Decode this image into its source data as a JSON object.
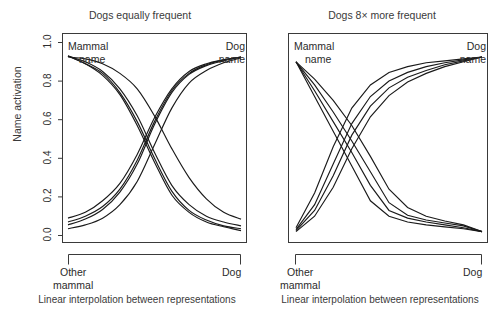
{
  "figure": {
    "background": "#ffffff",
    "line_color": "#1a1a1a",
    "axis_color": "#3a3a3a"
  },
  "panels": [
    {
      "id": "left",
      "title": "Dogs equally frequent",
      "caption": "Linear interpolation between representations",
      "ylabel": "Name activation",
      "ytick_labels": [
        "0.0",
        "0.2",
        "0.4",
        "0.6",
        "0.8",
        "1.0"
      ],
      "corner_label_left": "Mammal\nname",
      "corner_label_left_line1": "Mammal",
      "corner_label_left_line2": "name",
      "corner_label_right_line1": "Dog",
      "corner_label_right_line2": "name",
      "xaxis_left_line1": "Other",
      "xaxis_left_line2": "mammal",
      "xaxis_right": "Dog"
    },
    {
      "id": "right",
      "title": "Dogs 8× more frequent",
      "caption": "Linear interpolation between representations",
      "corner_label_left_line1": "Mammal",
      "corner_label_left_line2": "name",
      "corner_label_right_line1": "Dog",
      "corner_label_right_line2": "name",
      "xaxis_left_line1": "Other",
      "xaxis_left_line2": "mammal",
      "xaxis_right": "Dog"
    }
  ],
  "chart_data": [
    {
      "type": "line",
      "panel": "left",
      "title": "Dogs equally frequent",
      "xlabel": "Linear interpolation between representations",
      "ylabel": "Name activation",
      "xlim": [
        0,
        1
      ],
      "ylim": [
        0.0,
        1.0
      ],
      "yticks": [
        0.0,
        0.2,
        0.4,
        0.6,
        0.8,
        1.0
      ],
      "xtick_labels": [
        "Other mammal",
        "Dog"
      ],
      "grid": false,
      "legend": null,
      "annotations": [
        "Mammal name",
        "Dog name"
      ],
      "x": [
        0.0,
        0.1,
        0.2,
        0.3,
        0.4,
        0.5,
        0.6,
        0.7,
        0.8,
        0.9,
        1.0
      ],
      "series": [
        {
          "name": "mammal-name-1",
          "group": "mammal",
          "values": [
            0.93,
            0.9,
            0.85,
            0.76,
            0.62,
            0.43,
            0.26,
            0.16,
            0.1,
            0.07,
            0.05
          ]
        },
        {
          "name": "mammal-name-2",
          "group": "mammal",
          "values": [
            0.93,
            0.89,
            0.84,
            0.74,
            0.59,
            0.4,
            0.23,
            0.13,
            0.08,
            0.05,
            0.035
          ]
        },
        {
          "name": "mammal-name-3",
          "group": "mammal",
          "values": [
            0.93,
            0.89,
            0.83,
            0.73,
            0.57,
            0.38,
            0.21,
            0.12,
            0.07,
            0.045,
            0.025
          ]
        },
        {
          "name": "mammal-name-4",
          "group": "mammal",
          "values": [
            0.925,
            0.915,
            0.89,
            0.84,
            0.76,
            0.62,
            0.45,
            0.3,
            0.19,
            0.12,
            0.085
          ]
        },
        {
          "name": "dog-name-1",
          "group": "dog",
          "values": [
            0.09,
            0.12,
            0.18,
            0.27,
            0.42,
            0.61,
            0.76,
            0.85,
            0.89,
            0.91,
            0.925
          ]
        },
        {
          "name": "dog-name-2",
          "group": "dog",
          "values": [
            0.07,
            0.1,
            0.15,
            0.24,
            0.39,
            0.59,
            0.75,
            0.84,
            0.885,
            0.91,
            0.925
          ]
        },
        {
          "name": "dog-name-3",
          "group": "dog",
          "values": [
            0.055,
            0.085,
            0.135,
            0.225,
            0.37,
            0.575,
            0.74,
            0.835,
            0.88,
            0.905,
            0.925
          ]
        },
        {
          "name": "dog-name-4",
          "group": "dog",
          "values": [
            0.035,
            0.055,
            0.09,
            0.16,
            0.28,
            0.47,
            0.66,
            0.79,
            0.855,
            0.895,
            0.92
          ]
        }
      ]
    },
    {
      "type": "line",
      "panel": "right",
      "title": "Dogs 8× more frequent",
      "xlabel": "Linear interpolation between representations",
      "ylabel": "Name activation",
      "xlim": [
        0,
        1
      ],
      "ylim": [
        0.0,
        1.0
      ],
      "yticks": [
        0.0,
        0.2,
        0.4,
        0.6,
        0.8,
        1.0
      ],
      "xtick_labels": [
        "Other mammal",
        "Dog"
      ],
      "grid": false,
      "legend": null,
      "annotations": [
        "Mammal name",
        "Dog name"
      ],
      "x": [
        0.0,
        0.1,
        0.2,
        0.3,
        0.4,
        0.5,
        0.6,
        0.7,
        0.8,
        0.9,
        1.0
      ],
      "series": [
        {
          "name": "mammal-name-1",
          "group": "mammal",
          "values": [
            0.9,
            0.72,
            0.54,
            0.36,
            0.18,
            0.1,
            0.07,
            0.055,
            0.045,
            0.035,
            0.02
          ]
        },
        {
          "name": "mammal-name-2",
          "group": "mammal",
          "values": [
            0.9,
            0.75,
            0.59,
            0.43,
            0.26,
            0.13,
            0.09,
            0.07,
            0.055,
            0.04,
            0.02
          ]
        },
        {
          "name": "mammal-name-3",
          "group": "mammal",
          "values": [
            0.9,
            0.78,
            0.64,
            0.49,
            0.33,
            0.17,
            0.105,
            0.08,
            0.065,
            0.05,
            0.02
          ]
        },
        {
          "name": "mammal-name-4",
          "group": "mammal",
          "values": [
            0.9,
            0.81,
            0.7,
            0.57,
            0.41,
            0.24,
            0.145,
            0.1,
            0.075,
            0.055,
            0.02
          ]
        },
        {
          "name": "dog-name-1",
          "group": "dog",
          "values": [
            0.04,
            0.22,
            0.46,
            0.66,
            0.78,
            0.845,
            0.875,
            0.895,
            0.905,
            0.915,
            0.925
          ]
        },
        {
          "name": "dog-name-2",
          "group": "dog",
          "values": [
            0.03,
            0.16,
            0.37,
            0.58,
            0.72,
            0.8,
            0.845,
            0.875,
            0.895,
            0.91,
            0.925
          ]
        },
        {
          "name": "dog-name-3",
          "group": "dog",
          "values": [
            0.025,
            0.13,
            0.31,
            0.52,
            0.67,
            0.765,
            0.82,
            0.855,
            0.885,
            0.905,
            0.925
          ]
        },
        {
          "name": "dog-name-4",
          "group": "dog",
          "values": [
            0.02,
            0.1,
            0.25,
            0.45,
            0.615,
            0.725,
            0.795,
            0.84,
            0.875,
            0.9,
            0.925
          ]
        }
      ]
    }
  ]
}
